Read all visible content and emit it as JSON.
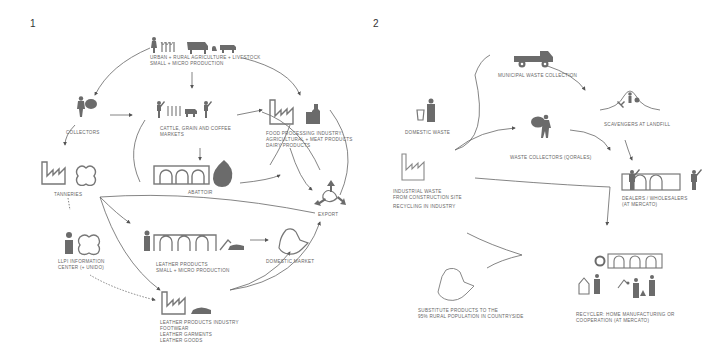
{
  "panel1": {
    "number": "1",
    "nodes": {
      "production": [
        "URBAN + RURAL AGRICULTURE + LIVESTOCK",
        "SMALL + MICRO PRODUCTION"
      ],
      "collectors": [
        "COLLECTORS"
      ],
      "markets": [
        "CATTLE, GRAIN AND COFFEE",
        "MARKETS"
      ],
      "food_processing": [
        "FOOD PROCESSING INDUSTRY:",
        "AGRICULTURAL + MEAT PRODUCTS",
        "DAIRY PRODUCTS"
      ],
      "tanneries": [
        "TANNERIES"
      ],
      "abattoir": [
        "ABATTOIR"
      ],
      "export": [
        "EXPORT"
      ],
      "llpi": [
        "LLPI INFORMATION",
        "CENTER (+ UNIDO)"
      ],
      "leather_small": [
        "LEATHER PRODUCTS",
        "SMALL + MICRO PRODUCTION"
      ],
      "domestic_market": [
        "DOMESTIC MARKET"
      ],
      "leather_industry": [
        "LEATHER PRODUCTS INDUSTRY",
        "FOOTWEAR",
        "LEATHER GARMENTS",
        "LEATHER GOODS"
      ]
    }
  },
  "panel2": {
    "number": "2",
    "nodes": {
      "municipal": [
        "MUNICIPAL WASTE COLLECTION"
      ],
      "domestic_waste": [
        "DOMESTIC WASTE"
      ],
      "scavengers": [
        "SCAVENGERS AT LANDFILL"
      ],
      "waste_collectors": [
        "WASTE COLLECTORS (QORALES)"
      ],
      "industrial_waste": [
        "INDUSTRIAL WASTE",
        "FROM CONSTRUCTION SITE"
      ],
      "recycling_industry": [
        "RECYCLING IN INDUSTRY"
      ],
      "dealers": [
        "DEALERS / WHOLESALERS",
        "(AT MERCATO)"
      ],
      "substitute": [
        "SUBSTITUTE PRODUCTS TO THE",
        "95% RURAL POPULATION IN COUNTRYSIDE"
      ],
      "recycler": [
        "RECYCLER: HOME MANUFACTURING OR",
        "COOPERATION (AT MERCATO)"
      ]
    }
  },
  "colors": {
    "icon": "#6b6b6b",
    "line": "#555555",
    "text": "#666666"
  }
}
